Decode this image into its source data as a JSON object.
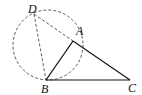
{
  "diagram": {
    "points": {
      "D": {
        "label": "D",
        "x": 34,
        "y": 14
      },
      "A": {
        "label": "A",
        "x": 73,
        "y": 41
      },
      "B": {
        "label": "B",
        "x": 46,
        "y": 80
      },
      "C": {
        "label": "C",
        "x": 130,
        "y": 80
      }
    },
    "circle": {
      "cx": 48,
      "cy": 45,
      "r": 35,
      "style": "dashed"
    },
    "segments": [
      {
        "from": "A",
        "to": "B",
        "style": "solid"
      },
      {
        "from": "A",
        "to": "C",
        "style": "solid"
      },
      {
        "from": "B",
        "to": "C",
        "style": "solid"
      },
      {
        "from": "D",
        "to": "A",
        "style": "dashed"
      },
      {
        "from": "D",
        "to": "B",
        "style": "dashed"
      }
    ]
  }
}
